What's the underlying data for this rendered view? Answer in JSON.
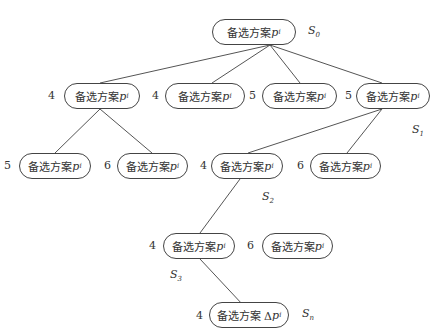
{
  "nodes": [
    {
      "id": "root",
      "text": "备选方案",
      "var": "p",
      "sub": "i",
      "cost": "",
      "state": "S",
      "state_sub": "0"
    },
    {
      "id": "n1",
      "text": "备选方案",
      "var": "p",
      "sub": "i",
      "cost": "4"
    },
    {
      "id": "n2",
      "text": "备选方案",
      "var": "p",
      "sub": "i",
      "cost": "4"
    },
    {
      "id": "n3",
      "text": "备选方案",
      "var": "p",
      "sub": "i",
      "cost": "5"
    },
    {
      "id": "n4",
      "text": "备选方案",
      "var": "p",
      "sub": "i",
      "cost": "5",
      "state": "S",
      "state_sub": "1"
    },
    {
      "id": "n5",
      "text": "备选方案",
      "var": "p",
      "sub": "i",
      "cost": "5"
    },
    {
      "id": "n6",
      "text": "备选方案",
      "var": "p",
      "sub": "i",
      "cost": "6"
    },
    {
      "id": "n7",
      "text": "备选方案",
      "var": "p",
      "sub": "i",
      "cost": "4",
      "state": "S",
      "state_sub": "2"
    },
    {
      "id": "n8",
      "text": "备选方案",
      "var": "p",
      "sub": "i",
      "cost": "6"
    },
    {
      "id": "n9",
      "text": "备选方案",
      "var": "p",
      "sub": "i",
      "cost": "4",
      "state": "S",
      "state_sub": "3"
    },
    {
      "id": "n10",
      "text": "备选方案",
      "var": "p",
      "sub": "i",
      "cost": "6"
    },
    {
      "id": "n11",
      "text": "备选方案 Δ",
      "var": "p",
      "sub": "i",
      "cost": "4",
      "state": "S",
      "state_sub": "n"
    }
  ]
}
